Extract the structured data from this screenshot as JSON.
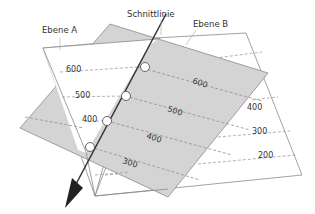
{
  "labels": {
    "plane_a": "Ebene A",
    "plane_b": "Ebene B",
    "intersection": "Schnittlinie"
  },
  "plane_a_contours": [
    "600",
    "500",
    "400"
  ],
  "plane_b_contours": [
    "400",
    "300",
    "200"
  ],
  "shaded_plane_contours": [
    "600",
    "500",
    "400",
    "300"
  ],
  "colors": {
    "shaded_plane": "#d4d4d4",
    "white_plane": "#ffffff",
    "edge": "#8a8a8a",
    "contour": "#9a9a9a",
    "intersection_line": "#333333"
  }
}
